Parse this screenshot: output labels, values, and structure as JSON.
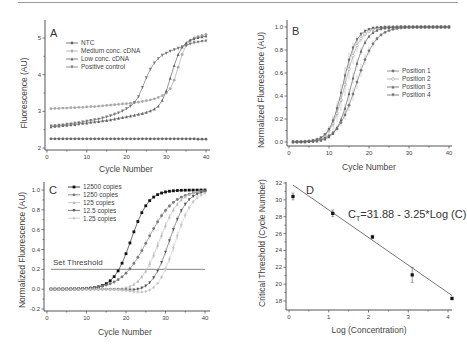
{
  "chart_data": [
    {
      "panel": "A",
      "type": "line",
      "xlabel": "Cycle Number",
      "ylabel": "Fluorescence (AU)",
      "xlim": [
        0,
        40
      ],
      "ylim": [
        2,
        5.3
      ],
      "xticks": [
        0,
        10,
        20,
        30,
        40
      ],
      "yticks": [
        2,
        3,
        4,
        5
      ],
      "legend_position": "top-left",
      "x": [
        1,
        2,
        3,
        4,
        5,
        6,
        7,
        8,
        9,
        10,
        11,
        12,
        13,
        14,
        15,
        16,
        17,
        18,
        19,
        20,
        21,
        22,
        23,
        24,
        25,
        26,
        27,
        28,
        29,
        30,
        31,
        32,
        33,
        34,
        35,
        36,
        37,
        38,
        39,
        40
      ],
      "series": [
        {
          "name": "NTC",
          "marker": "circle",
          "color": "#666666",
          "values": [
            2.25,
            2.25,
            2.25,
            2.25,
            2.25,
            2.25,
            2.25,
            2.25,
            2.25,
            2.25,
            2.25,
            2.25,
            2.25,
            2.25,
            2.25,
            2.25,
            2.25,
            2.25,
            2.25,
            2.25,
            2.25,
            2.25,
            2.25,
            2.25,
            2.25,
            2.25,
            2.25,
            2.25,
            2.25,
            2.25,
            2.25,
            2.25,
            2.25,
            2.25,
            2.25,
            2.25,
            2.25,
            2.24,
            2.24,
            2.24
          ]
        },
        {
          "name": "Medium conc. cDNA",
          "marker": "circle",
          "color": "#aaaaaa",
          "values": [
            3.07,
            3.08,
            3.08,
            3.09,
            3.09,
            3.1,
            3.1,
            3.11,
            3.11,
            3.12,
            3.13,
            3.13,
            3.14,
            3.15,
            3.16,
            3.17,
            3.18,
            3.19,
            3.2,
            3.21,
            3.22,
            3.24,
            3.25,
            3.27,
            3.29,
            3.31,
            3.34,
            3.38,
            3.43,
            3.5,
            3.62,
            3.85,
            4.2,
            4.55,
            4.8,
            4.93,
            5.0,
            5.04,
            5.07,
            5.1
          ]
        },
        {
          "name": "Low conc. cDNA",
          "marker": "triangle-up",
          "color": "#666666",
          "values": [
            2.58,
            2.59,
            2.6,
            2.61,
            2.62,
            2.63,
            2.64,
            2.66,
            2.67,
            2.68,
            2.7,
            2.71,
            2.72,
            2.74,
            2.75,
            2.77,
            2.79,
            2.81,
            2.83,
            2.85,
            2.87,
            2.89,
            2.92,
            2.94,
            2.97,
            3.01,
            3.06,
            3.14,
            3.3,
            3.55,
            3.9,
            4.25,
            4.55,
            4.75,
            4.87,
            4.94,
            4.98,
            5.01,
            5.03,
            5.05
          ]
        },
        {
          "name": "Positive control",
          "marker": "triangle-down",
          "color": "#777777",
          "values": [
            2.6,
            2.61,
            2.62,
            2.63,
            2.65,
            2.66,
            2.68,
            2.69,
            2.71,
            2.73,
            2.75,
            2.77,
            2.79,
            2.82,
            2.85,
            2.88,
            2.92,
            2.96,
            3.01,
            3.07,
            3.14,
            3.24,
            3.4,
            3.65,
            3.92,
            4.15,
            4.32,
            4.44,
            4.53,
            4.59,
            4.64,
            4.68,
            4.72,
            4.76,
            4.8,
            4.84,
            4.87,
            4.89,
            4.91,
            4.92
          ]
        }
      ]
    },
    {
      "panel": "B",
      "type": "line",
      "xlabel": "Cycle Number",
      "ylabel": "Normalized Fluorescence (AU)",
      "xlim": [
        0,
        40
      ],
      "ylim": [
        -0.05,
        1.02
      ],
      "xticks": [
        0,
        10,
        20,
        30,
        40
      ],
      "yticks": [
        0.0,
        0.2,
        0.4,
        0.6,
        0.8,
        1.0
      ],
      "ytick_labels": [
        "0.0",
        "0.2",
        "0.4",
        "0.6",
        "0.8",
        "1.0"
      ],
      "legend_position": "right",
      "error_bars": true,
      "x": [
        1,
        2,
        3,
        4,
        5,
        6,
        7,
        8,
        9,
        10,
        11,
        12,
        13,
        14,
        15,
        16,
        17,
        18,
        19,
        20,
        21,
        22,
        23,
        24,
        25,
        26,
        27,
        28,
        29,
        30,
        31,
        32,
        33,
        34,
        35,
        36,
        37,
        38,
        39,
        40
      ],
      "series": [
        {
          "name": "Position 1",
          "marker": "circle",
          "color": "#777777",
          "midpoint": 16.8,
          "slope": 0.42,
          "err": 0.06
        },
        {
          "name": "Position 2",
          "marker": "circle-open",
          "color": "#aaaaaa",
          "midpoint": 14.0,
          "slope": 0.55,
          "err": 0.1
        },
        {
          "name": "Position 3",
          "marker": "triangle-up",
          "color": "#666666",
          "midpoint": 15.6,
          "slope": 0.55,
          "err": 0.05
        },
        {
          "name": "Position 4",
          "marker": "triangle-down",
          "color": "#666666",
          "midpoint": 13.5,
          "slope": 0.6,
          "err": 0.08
        }
      ]
    },
    {
      "panel": "C",
      "type": "line",
      "xlabel": "Cycle Number",
      "ylabel": "Normalized Fluorescence (AU)",
      "xlim": [
        0,
        40
      ],
      "ylim": [
        -0.2,
        1.02
      ],
      "xticks": [
        0,
        10,
        20,
        30,
        40
      ],
      "yticks": [
        -0.2,
        0.0,
        0.2,
        0.4,
        0.6,
        0.8,
        1.0
      ],
      "ytick_labels": [
        "-0.2",
        "0.0",
        "0.2",
        "0.4",
        "0.6",
        "0.8",
        "1.0"
      ],
      "legend_position": "top-left",
      "threshold": {
        "value": 0.2,
        "label": "Set Threshold"
      },
      "x": [
        1,
        2,
        3,
        4,
        5,
        6,
        7,
        8,
        9,
        10,
        11,
        12,
        13,
        14,
        15,
        16,
        17,
        18,
        19,
        20,
        21,
        22,
        23,
        24,
        25,
        26,
        27,
        28,
        29,
        30,
        31,
        32,
        33,
        34,
        35,
        36,
        37,
        38,
        39,
        40
      ],
      "series": [
        {
          "name": "12500 copies",
          "marker": "square",
          "color": "#111111",
          "midpoint": 21.3,
          "slope": 0.45,
          "dip": 0.0
        },
        {
          "name": "1250 copies",
          "marker": "circle",
          "color": "#777777",
          "midpoint": 25.5,
          "slope": 0.3,
          "dip": 0.0
        },
        {
          "name": "125 copies",
          "marker": "triangle-up",
          "color": "#bbbbbb",
          "midpoint": 28.5,
          "slope": 0.4,
          "dip": -0.02
        },
        {
          "name": "12.5 copies",
          "marker": "triangle-down",
          "color": "#555555",
          "midpoint": 31.0,
          "slope": 0.45,
          "dip": -0.03
        },
        {
          "name": "1.25 copies",
          "marker": "diamond",
          "color": "#c8c8c8",
          "midpoint": 32.5,
          "slope": 0.45,
          "dip": -0.06
        }
      ]
    },
    {
      "panel": "D",
      "type": "scatter",
      "xlabel": "Log (Concentration)",
      "ylabel": "Critical Threshold (Cycle Number)",
      "xlim": [
        -0.1,
        4.2
      ],
      "ylim": [
        17,
        32
      ],
      "xticks": [
        0,
        1,
        2,
        3,
        4
      ],
      "yticks": [
        18,
        20,
        22,
        24,
        26,
        28,
        30,
        32
      ],
      "annotation": "C_T=31.88 - 3.25*Log (C)",
      "annotation_main": "C",
      "annotation_sub": "T",
      "annotation_rest": "=31.88 - 3.25*Log (C)",
      "fit": {
        "intercept": 31.88,
        "slope": -3.25,
        "xrange": [
          0.1,
          4.1
        ]
      },
      "points": [
        {
          "x": 0.1,
          "y": 30.4,
          "err": 0.4
        },
        {
          "x": 1.1,
          "y": 28.4,
          "err": 0.4
        },
        {
          "x": 2.1,
          "y": 25.6,
          "err": 0.2
        },
        {
          "x": 3.1,
          "y": 21.1,
          "err": 0.9
        },
        {
          "x": 4.1,
          "y": 18.3,
          "err": 0.15
        }
      ]
    }
  ],
  "panel_labels": [
    "A",
    "B",
    "C",
    "D"
  ]
}
